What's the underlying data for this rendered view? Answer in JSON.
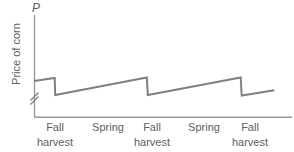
{
  "chart_data": {
    "type": "line",
    "title": "",
    "subtitle": "",
    "ylabel": "Price of corn",
    "xlabel": "",
    "axis_symbol": "P",
    "y_axis_break": true,
    "grid": false,
    "legend": null,
    "annotations": [],
    "xlim": [
      0,
      10
    ],
    "ylim": [
      0,
      10
    ],
    "x_tick_labels": [
      "Fall harvest",
      "Spring",
      "Fall harvest",
      "Spring",
      "Fall harvest"
    ],
    "x_ticks": [
      0.85,
      2.9,
      4.6,
      6.6,
      8.35
    ],
    "y_tick_labels": [],
    "series": [
      {
        "name": "Price of corn",
        "color": "#808080",
        "line_width": 2,
        "points": [
          {
            "x": 0.0,
            "y": 4.55
          },
          {
            "x": 0.83,
            "y": 4.95
          },
          {
            "x": 0.85,
            "y": 2.8
          },
          {
            "x": 4.53,
            "y": 5.0
          },
          {
            "x": 4.57,
            "y": 2.8
          },
          {
            "x": 8.3,
            "y": 5.0
          },
          {
            "x": 8.34,
            "y": 2.74
          },
          {
            "x": 9.65,
            "y": 3.4
          }
        ]
      }
    ]
  },
  "axes": {
    "y_axis_symbol": "P",
    "y_axis_title": "Price of corn",
    "break_marker": "//"
  },
  "x_axis": {
    "ticks": [
      {
        "line1": "Fall",
        "line2": "harvest"
      },
      {
        "line1": "Spring",
        "line2": ""
      },
      {
        "line1": "Fall",
        "line2": "harvest"
      },
      {
        "line1": "Spring",
        "line2": ""
      },
      {
        "line1": "Fall",
        "line2": "harvest"
      }
    ]
  },
  "colors": {
    "axis": "#9a9a9a",
    "data_line": "#808080",
    "text": "#5e5e5e",
    "background": "#ffffff"
  }
}
